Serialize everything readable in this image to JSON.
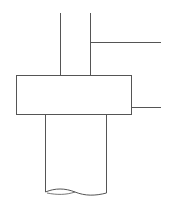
{
  "diagram": {
    "title": "",
    "stroke_color": "#555555",
    "background": "#ffffff",
    "elements": [
      {
        "type": "shaft-line-left",
        "x": 60,
        "y1": 13,
        "y2": 75
      },
      {
        "type": "shaft-line-right",
        "x": 90,
        "y1": 13,
        "y2": 75
      },
      {
        "type": "leader-line-upper",
        "x1": 90,
        "x2": 161,
        "y": 42
      },
      {
        "type": "collar-box",
        "x": 16,
        "y": 75,
        "width": 115,
        "height": 39
      },
      {
        "type": "leader-line-lower",
        "x1": 131,
        "x2": 161,
        "y": 107
      },
      {
        "type": "tube-line-left",
        "x": 45,
        "y1": 114,
        "y2": 192
      },
      {
        "type": "tube-line-right",
        "x": 106,
        "y1": 114,
        "y2": 193
      },
      {
        "type": "break-line",
        "y": 192
      }
    ]
  }
}
